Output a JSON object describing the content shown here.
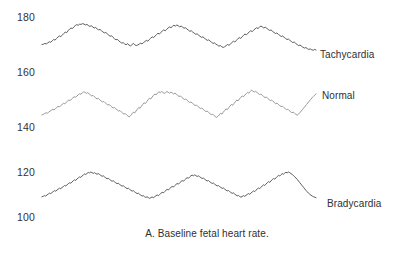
{
  "caption": "A. Baseline fetal heart rate.",
  "axis": {
    "ticks": [
      {
        "value": "180",
        "y": 11
      },
      {
        "value": "160",
        "y": 66
      },
      {
        "value": "140",
        "y": 121
      },
      {
        "value": "120",
        "y": 166
      },
      {
        "value": "100",
        "y": 211
      }
    ],
    "tick_x": 17
  },
  "series_labels": [
    {
      "name": "Tachycardia",
      "x": 320,
      "y": 49
    },
    {
      "name": "Normal",
      "x": 322,
      "y": 90
    },
    {
      "name": "Bradycardia",
      "x": 327,
      "y": 198
    }
  ],
  "colors": {
    "tachycardia_line": "#4a4a4a",
    "normal_line": "#8c8c8c",
    "bradycardia_line": "#4a4a4a",
    "text": "#2f2f2f",
    "background": "#ffffff"
  },
  "chart_data": {
    "type": "line",
    "title": "A. Baseline fetal heart rate.",
    "xlabel": "",
    "ylabel": "Fetal heart rate (bpm)",
    "ylim": [
      95,
      185
    ],
    "yticks": [
      100,
      120,
      140,
      160,
      180
    ],
    "grid": false,
    "legend_position": "right-inline",
    "x_axis_note": "time (unlabeled, continuous tracing)",
    "series": [
      {
        "name": "Tachycardia",
        "color": "#4a4a4a",
        "baseline": 172,
        "range": [
          168,
          178
        ],
        "values": [
          170.0,
          170.1,
          170.4,
          170.2,
          170.6,
          171.0,
          170.8,
          171.3,
          171.8,
          171.6,
          172.2,
          172.7,
          173.1,
          172.9,
          173.4,
          174.0,
          174.5,
          174.3,
          175.0,
          175.6,
          176.0,
          175.8,
          176.4,
          176.9,
          177.2,
          177.0,
          177.4,
          177.3,
          177.6,
          177.4,
          177.1,
          177.3,
          176.9,
          176.6,
          176.8,
          176.4,
          176.0,
          176.2,
          175.7,
          175.3,
          175.5,
          175.0,
          174.6,
          174.2,
          174.4,
          173.9,
          173.4,
          173.0,
          173.2,
          172.6,
          172.1,
          171.7,
          171.9,
          171.3,
          170.9,
          170.5,
          170.7,
          170.2,
          169.9,
          170.3,
          169.8,
          169.5,
          169.9,
          170.4,
          169.9,
          169.6,
          169.8,
          170.1,
          170.5,
          170.2,
          170.7,
          171.1,
          171.5,
          171.2,
          171.8,
          172.3,
          172.8,
          172.5,
          173.1,
          173.6,
          174.1,
          173.8,
          174.4,
          174.9,
          175.3,
          175.0,
          175.5,
          176.0,
          176.4,
          176.1,
          176.6,
          177.0,
          176.7,
          177.1,
          176.8,
          176.4,
          176.7,
          176.3,
          175.9,
          176.1,
          175.6,
          175.2,
          174.8,
          175.0,
          174.5,
          174.1,
          173.7,
          173.9,
          173.4,
          173.0,
          172.6,
          172.8,
          172.3,
          171.9,
          171.5,
          171.7,
          171.2,
          170.8,
          170.4,
          170.6,
          170.1,
          169.8,
          169.4,
          169.6,
          169.2,
          168.9,
          169.2,
          169.6,
          170.0,
          169.7,
          170.2,
          170.7,
          171.2,
          170.9,
          171.5,
          172.0,
          172.5,
          172.2,
          172.8,
          173.3,
          173.8,
          173.5,
          174.1,
          174.6,
          175.0,
          174.7,
          175.2,
          175.7,
          176.1,
          175.8,
          176.3,
          176.7,
          176.4,
          176.0,
          176.3,
          175.9,
          175.5,
          175.1,
          175.3,
          174.8,
          174.4,
          174.0,
          174.2,
          173.7,
          173.3,
          172.9,
          173.1,
          172.6,
          172.2,
          171.8,
          172.0,
          171.5,
          171.1,
          170.7,
          170.9,
          170.4,
          170.0,
          169.6,
          169.8,
          169.4,
          169.0,
          168.7,
          168.9,
          168.5,
          168.2,
          168.4,
          168.1,
          167.9,
          168.2,
          168.0
        ]
      },
      {
        "name": "Normal",
        "color": "#8c8c8c",
        "baseline": 148,
        "range": [
          143,
          154
        ],
        "values": [
          144.4,
          144.6,
          144.9,
          145.2,
          145.0,
          145.4,
          145.8,
          146.1,
          146.4,
          146.2,
          146.7,
          147.1,
          147.5,
          147.3,
          147.8,
          148.2,
          148.6,
          148.4,
          149.0,
          149.4,
          149.8,
          149.6,
          150.2,
          150.6,
          151.0,
          150.8,
          151.3,
          151.7,
          152.1,
          151.9,
          152.4,
          152.8,
          152.6,
          152.2,
          152.5,
          152.1,
          151.7,
          151.3,
          151.5,
          151.0,
          150.6,
          150.2,
          150.4,
          149.9,
          149.5,
          149.1,
          149.3,
          148.8,
          148.4,
          148.0,
          148.2,
          147.7,
          147.3,
          146.9,
          147.1,
          146.6,
          146.2,
          145.8,
          146.0,
          145.5,
          145.1,
          144.7,
          144.9,
          144.4,
          144.0,
          143.7,
          144.2,
          144.8,
          145.4,
          145.1,
          145.8,
          146.5,
          147.1,
          146.8,
          147.5,
          148.2,
          148.8,
          148.5,
          149.2,
          149.9,
          150.5,
          150.2,
          150.9,
          151.5,
          152.0,
          151.7,
          152.3,
          152.8,
          152.5,
          152.9,
          152.6,
          152.2,
          152.5,
          152.9,
          152.6,
          152.3,
          152.7,
          152.4,
          152.0,
          152.3,
          151.9,
          151.5,
          151.1,
          151.3,
          150.8,
          150.4,
          150.0,
          150.2,
          149.7,
          149.3,
          148.9,
          149.1,
          148.6,
          148.2,
          147.8,
          148.0,
          147.5,
          147.1,
          146.7,
          146.9,
          146.4,
          146.0,
          145.6,
          145.8,
          145.3,
          144.9,
          144.5,
          144.7,
          144.2,
          143.8,
          143.5,
          143.9,
          144.4,
          145.0,
          144.7,
          145.4,
          146.0,
          146.6,
          146.3,
          147.0,
          147.6,
          148.2,
          147.9,
          148.6,
          149.2,
          149.8,
          149.5,
          150.2,
          150.8,
          151.3,
          151.0,
          151.6,
          152.1,
          152.6,
          152.3,
          152.9,
          153.4,
          153.1,
          152.7,
          153.0,
          152.6,
          152.2,
          151.8,
          152.0,
          151.5,
          151.1,
          150.7,
          150.9,
          150.4,
          150.0,
          149.6,
          149.8,
          149.3,
          148.9,
          148.5,
          148.7,
          148.2,
          147.8,
          147.4,
          147.6,
          147.1,
          146.7,
          146.3,
          146.5,
          146.0,
          145.6,
          145.2,
          145.4,
          145.0,
          144.6,
          144.3,
          144.7,
          145.2,
          145.8,
          146.4,
          147.0,
          147.6,
          148.2,
          148.8,
          149.4,
          150.0,
          150.6,
          151.1,
          151.6,
          152.0
        ]
      },
      {
        "name": "Bradycardia",
        "color": "#4a4a4a",
        "baseline": 113,
        "range": [
          107,
          121
        ],
        "values": [
          109.0,
          109.2,
          109.5,
          109.3,
          109.8,
          110.2,
          110.6,
          110.4,
          110.9,
          111.3,
          111.7,
          111.5,
          112.0,
          112.4,
          112.8,
          112.6,
          113.1,
          113.5,
          114.0,
          113.8,
          114.3,
          114.8,
          115.2,
          115.0,
          115.6,
          116.1,
          116.5,
          116.3,
          116.9,
          117.4,
          117.8,
          117.6,
          118.2,
          118.7,
          119.1,
          118.9,
          119.4,
          119.8,
          119.6,
          120.0,
          119.7,
          119.4,
          119.7,
          119.3,
          119.0,
          119.3,
          118.9,
          118.5,
          118.1,
          118.3,
          117.8,
          117.4,
          117.0,
          117.2,
          116.7,
          116.3,
          115.9,
          116.1,
          115.6,
          115.2,
          114.8,
          115.0,
          114.5,
          114.1,
          113.7,
          113.9,
          113.4,
          113.0,
          112.6,
          112.8,
          112.3,
          111.9,
          111.5,
          111.7,
          111.2,
          110.8,
          110.4,
          110.6,
          110.1,
          109.7,
          109.3,
          109.5,
          109.0,
          108.7,
          109.0,
          108.6,
          108.3,
          108.6,
          108.9,
          108.6,
          109.0,
          109.4,
          109.8,
          109.5,
          110.0,
          110.5,
          111.0,
          110.7,
          111.3,
          111.8,
          112.3,
          112.0,
          112.6,
          113.1,
          113.6,
          113.3,
          113.9,
          114.4,
          114.9,
          114.6,
          115.2,
          115.7,
          116.2,
          115.9,
          116.5,
          117.0,
          117.5,
          117.2,
          117.8,
          118.3,
          118.6,
          118.3,
          118.7,
          118.4,
          118.0,
          118.3,
          117.9,
          117.5,
          117.1,
          117.3,
          116.8,
          116.4,
          116.0,
          116.2,
          115.7,
          115.3,
          114.9,
          115.1,
          114.6,
          114.2,
          113.8,
          114.0,
          113.5,
          113.1,
          112.7,
          112.9,
          112.4,
          112.0,
          111.6,
          111.8,
          111.3,
          110.9,
          110.5,
          110.7,
          110.2,
          109.8,
          109.4,
          109.6,
          109.1,
          108.8,
          109.1,
          109.5,
          109.2,
          109.6,
          110.0,
          110.4,
          110.1,
          110.6,
          111.1,
          111.6,
          111.3,
          111.9,
          112.4,
          112.9,
          112.6,
          113.2,
          113.8,
          114.3,
          114.0,
          114.6,
          115.2,
          115.7,
          115.4,
          116.0,
          116.6,
          117.1,
          116.8,
          117.4,
          118.0,
          118.5,
          118.2,
          118.8,
          119.3,
          119.0,
          119.5,
          119.9,
          119.6,
          120.0,
          119.7,
          119.3,
          118.9,
          118.4,
          117.9,
          117.3,
          116.7,
          116.0,
          115.3,
          114.6,
          113.9,
          113.2,
          112.5,
          111.8,
          111.2,
          110.6,
          110.1,
          109.7,
          109.3,
          109.0,
          108.8,
          108.6
        ]
      }
    ]
  }
}
